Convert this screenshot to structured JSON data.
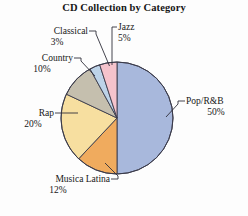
{
  "chart_data": {
    "type": "pie",
    "title": "CD Collection by Category",
    "xlabel": "",
    "ylabel": "",
    "legend": "none",
    "grid": false,
    "units": "percent",
    "categories": [
      "Pop/R&B",
      "Musica Latina",
      "Rap",
      "Country",
      "Classical",
      "Jazz"
    ],
    "values": [
      50,
      12,
      20,
      10,
      3,
      5
    ],
    "labels": [
      "50%",
      "12%",
      "20%",
      "10%",
      "3%",
      "5%"
    ],
    "colors": [
      "#a8b8dc",
      "#f0ab5e",
      "#f7dfa0",
      "#c5bfae",
      "#bdd3e8",
      "#f5c3cc"
    ],
    "slices": [
      {
        "name": "Pop/R&B",
        "value": 50,
        "label": "50%",
        "color": "#a8b8dc"
      },
      {
        "name": "Musica Latina",
        "value": 12,
        "label": "12%",
        "color": "#f0ab5e"
      },
      {
        "name": "Rap",
        "value": 20,
        "label": "20%",
        "color": "#f7dfa0"
      },
      {
        "name": "Country",
        "value": 10,
        "label": "10%",
        "color": "#c5bfae"
      },
      {
        "name": "Classical",
        "value": 3,
        "label": "3%",
        "color": "#bdd3e8"
      },
      {
        "name": "Jazz",
        "value": 5,
        "label": "5%",
        "color": "#f5c3cc"
      }
    ]
  },
  "annotations": {
    "classical": {
      "name": "Classical",
      "pct": "3%"
    },
    "jazz": {
      "name": "Jazz",
      "pct": "5%"
    },
    "country": {
      "name": "Country",
      "pct": "10%"
    },
    "rap": {
      "name": "Rap",
      "pct": "20%"
    },
    "musica": {
      "name": "Musica Latina",
      "pct": "12%"
    },
    "pop": {
      "name": "Pop/R&B",
      "pct": "50%"
    }
  },
  "style": {
    "background": "#fdfdfd",
    "outline": "#3b3b4a",
    "text": "#171717"
  }
}
